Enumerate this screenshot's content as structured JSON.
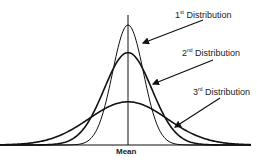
{
  "chart_data": {
    "type": "line",
    "title": "",
    "xlabel": "Mean",
    "ylabel": "",
    "grid": false,
    "series": [
      {
        "name": "1st Distribution",
        "label_num": "1",
        "label_sup": "st",
        "label_rest": " Distribution",
        "mean": 0,
        "sd": 0.55,
        "peak": 1.0
      },
      {
        "name": "2nd Distribution",
        "label_num": "2",
        "label_sup": "nd",
        "label_rest": " Distribution",
        "mean": 0,
        "sd": 0.85,
        "peak": 0.77
      },
      {
        "name": "3rd Distribution",
        "label_num": "3",
        "label_sup": "rd",
        "label_rest": " Distribution",
        "mean": 0,
        "sd": 1.4,
        "peak": 0.36
      }
    ],
    "annotations": [
      "1st Distribution",
      "2nd Distribution",
      "3rd Distribution",
      "Mean"
    ]
  },
  "labels": {
    "mean": "Mean",
    "d1num": "1",
    "d1sup": "st",
    "d1rest": " Distribution",
    "d2num": "2",
    "d2sup": "nd",
    "d2rest": " Distribution",
    "d3num": "3",
    "d3sup": "rd",
    "d3rest": " Distribution"
  }
}
